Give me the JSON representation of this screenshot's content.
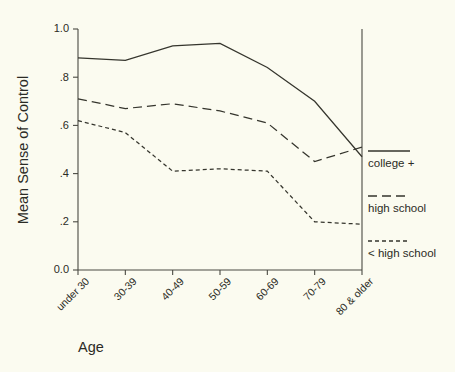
{
  "chart_data": {
    "type": "line",
    "title": "",
    "xlabel": "Age",
    "ylabel": "Mean Sense of Control",
    "categories": [
      "under 30",
      "30-39",
      "40-49",
      "50-59",
      "60-69",
      "70-79",
      "80 & older"
    ],
    "ylim": [
      0.0,
      1.0
    ],
    "ytick_labels": [
      "1.0",
      ".8",
      ".6",
      ".4",
      ".2",
      "0.0"
    ],
    "ytick_values": [
      1.0,
      0.8,
      0.6,
      0.4,
      0.2,
      0.0
    ],
    "grid": false,
    "legend_position": "right",
    "series": [
      {
        "name": "college +",
        "style": "solid",
        "values": [
          0.88,
          0.87,
          0.93,
          0.94,
          0.84,
          0.7,
          0.47
        ]
      },
      {
        "name": "high school",
        "style": "long-dash",
        "values": [
          0.71,
          0.67,
          0.69,
          0.66,
          0.61,
          0.45,
          0.51
        ]
      },
      {
        "name": "< high school",
        "style": "short-dash",
        "values": [
          0.62,
          0.57,
          0.41,
          0.42,
          0.41,
          0.2,
          0.19
        ]
      }
    ],
    "colors": {
      "background": "#fbfbf0",
      "axis": "#4a4a42",
      "line": "#35352d",
      "text": "#2b2b25"
    }
  }
}
